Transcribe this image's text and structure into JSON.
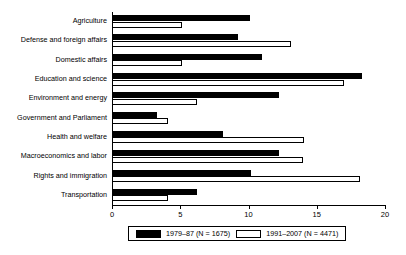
{
  "chart_data": {
    "type": "bar",
    "orientation": "horizontal",
    "title": "",
    "xlabel": "",
    "ylabel": "",
    "xlim": [
      0,
      20
    ],
    "xticks": [
      0,
      5,
      10,
      15,
      20
    ],
    "grid": false,
    "legend_position": "bottom",
    "categories": [
      "Agriculture",
      "Defense and foreign affairs",
      "Domestic affairs",
      "Education and science",
      "Environment and energy",
      "Government and Parliament",
      "Health and welfare",
      "Macroeconomics and labor",
      "Rights and immigration",
      "Transportation"
    ],
    "series": [
      {
        "name": "1979–87 (N = 1675)",
        "color": "#000000",
        "values": [
          10.1,
          9.2,
          11.0,
          18.3,
          12.2,
          3.3,
          8.1,
          12.2,
          10.2,
          6.2
        ]
      },
      {
        "name": "1991–2007 (N = 4471)",
        "color": "#ffffff",
        "values": [
          5.1,
          13.1,
          5.1,
          17.0,
          6.2,
          4.1,
          14.1,
          14.0,
          18.2,
          4.1
        ]
      }
    ]
  },
  "axis": {
    "tick_labels": [
      "0",
      "5",
      "10",
      "15",
      "20"
    ]
  },
  "legend": {
    "entries": [
      {
        "label": "1979–87 (N = 1675)",
        "swatch": "filled-black-swatch"
      },
      {
        "label": "1991–2007 (N = 4471)",
        "swatch": "hollow-white-swatch"
      }
    ]
  },
  "caption": {
    "text": ""
  }
}
